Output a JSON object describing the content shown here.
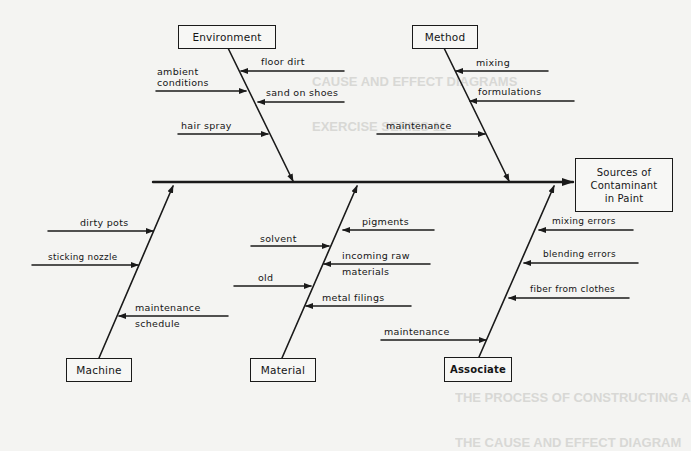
{
  "diagram": {
    "type": "fishbone",
    "effect": {
      "lines": [
        "Sources of",
        "Contaminant",
        "in Paint"
      ]
    },
    "categories": {
      "environment": {
        "label": "Environment",
        "causes": [
          "floor dirt",
          "ambient",
          "conditions",
          "sand on shoes",
          "hair spray"
        ]
      },
      "method": {
        "label": "Method",
        "causes": [
          "mixing",
          "formulations",
          "maintenance"
        ]
      },
      "machine": {
        "label": "Machine",
        "causes": [
          "dirty pots",
          "sticking nozzle",
          "maintenance",
          "schedule"
        ]
      },
      "material": {
        "label": "Material",
        "causes": [
          "pigments",
          "solvent",
          "incoming raw",
          "materials",
          "old",
          "metal filings"
        ]
      },
      "associate": {
        "label": "Associate",
        "causes": [
          "mixing errors",
          "blending errors",
          "fiber from clothes",
          "maintenance"
        ]
      }
    },
    "colors": {
      "ink": "#1a1a1a",
      "paper": "#f4f4f2",
      "bleed_through": "#c9c9c6"
    }
  },
  "background_bleed": {
    "heading": [
      "CAUSE AND EFFECT DIAGRAMS",
      "EXERCISE SERIES 11"
    ],
    "footer": [
      "THE PROCESS OF CONSTRUCTING A",
      "THE CAUSE AND EFFECT DIAGRAM"
    ]
  }
}
